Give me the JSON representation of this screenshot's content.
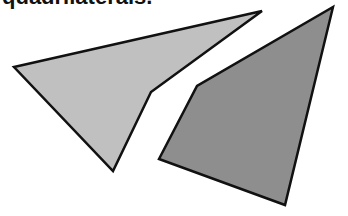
{
  "caption": {
    "text": "quadrilaterals."
  },
  "shapes": [
    {
      "name": "left-quadrilateral",
      "fill": "#c0c0c0",
      "stroke": "#111111",
      "points": "14,67 262,11 151,92 113,171"
    },
    {
      "name": "right-quadrilateral",
      "fill": "#8e8e8e",
      "stroke": "#111111",
      "points": "333,7 285,205 159,159 197,86"
    }
  ]
}
